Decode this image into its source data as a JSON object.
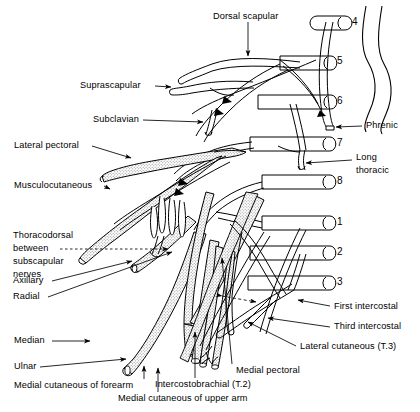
{
  "figure": {
    "type": "anatomical-line-diagram",
    "background_color": "#ffffff",
    "ink_color": "#000000",
    "nerve_fill": "#e8e8e8"
  },
  "spinal_roots": [
    {
      "id": "C4",
      "number": "4",
      "x": 352,
      "y": 23
    },
    {
      "id": "C5",
      "number": "5",
      "x": 337,
      "y": 62
    },
    {
      "id": "C6",
      "number": "6",
      "x": 337,
      "y": 101
    },
    {
      "id": "C7",
      "number": "7",
      "x": 337,
      "y": 143
    },
    {
      "id": "C8",
      "number": "8",
      "x": 337,
      "y": 181
    },
    {
      "id": "T1",
      "number": "1",
      "x": 337,
      "y": 222
    },
    {
      "id": "T2",
      "number": "2",
      "x": 337,
      "y": 252
    },
    {
      "id": "T3",
      "number": "3",
      "x": 337,
      "y": 282
    }
  ],
  "labels": {
    "dorsal_scapular": "Dorsal scapular",
    "suprascapular": "Suprascapular",
    "subclavian": "Subclavian",
    "lateral_pectoral": "Lateral pectoral",
    "musculocutaneous": "Musculocutaneous",
    "thoracodorsal_l1": "Thoracodorsal",
    "thoracodorsal_l2": "between",
    "thoracodorsal_l3": "subscapular",
    "thoracodorsal_l4": "nerves",
    "axillary": "Axillary",
    "radial": "Radial",
    "median": "Median",
    "ulnar": "Ulnar",
    "medial_cutaneous_forearm": "Medial cutaneous of forearm",
    "medial_cutaneous_upper_arm": "Medial cutaneous of upper arm",
    "intercostobrachial": "Intercostobrachial (T.2)",
    "medial_pectoral": "Medial pectoral",
    "lateral_cutaneous_t3": "Lateral cutaneous (T.3)",
    "third_intercostal": "Third intercostal",
    "first_intercostal": "First intercostal",
    "long_thoracic_l1": "Long",
    "long_thoracic_l2": "thoracic",
    "phrenic": "Phrenic"
  }
}
